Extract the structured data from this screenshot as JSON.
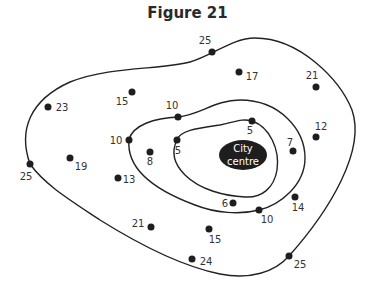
{
  "figure": {
    "title": "Figure 21",
    "city_centre_label_line1": "City",
    "city_centre_label_line2": "centre"
  },
  "points": [
    {
      "value": "25",
      "x": 212,
      "y": 52
    },
    {
      "value": "17",
      "x": 239,
      "y": 72
    },
    {
      "value": "21",
      "x": 316,
      "y": 87
    },
    {
      "value": "23",
      "x": 48,
      "y": 107
    },
    {
      "value": "15",
      "x": 132,
      "y": 92
    },
    {
      "value": "10",
      "x": 178,
      "y": 117
    },
    {
      "value": "5",
      "x": 252,
      "y": 121
    },
    {
      "value": "12",
      "x": 316,
      "y": 137
    },
    {
      "value": "10",
      "x": 129,
      "y": 140
    },
    {
      "value": "5",
      "x": 177,
      "y": 140
    },
    {
      "value": "7",
      "x": 293,
      "y": 151
    },
    {
      "value": "8",
      "x": 150,
      "y": 152
    },
    {
      "value": "19",
      "x": 70,
      "y": 158
    },
    {
      "value": "25",
      "x": 30,
      "y": 164
    },
    {
      "value": "13",
      "x": 118,
      "y": 178
    },
    {
      "value": "14",
      "x": 295,
      "y": 197
    },
    {
      "value": "6",
      "x": 233,
      "y": 203
    },
    {
      "value": "10",
      "x": 259,
      "y": 210
    },
    {
      "value": "21",
      "x": 151,
      "y": 227
    },
    {
      "value": "15",
      "x": 209,
      "y": 229
    },
    {
      "value": "24",
      "x": 192,
      "y": 259
    },
    {
      "value": "25",
      "x": 289,
      "y": 256
    }
  ],
  "contours": [
    {
      "value": 25,
      "label": "25"
    },
    {
      "value": 10,
      "label": "10"
    },
    {
      "value": 5,
      "label": "5"
    }
  ],
  "colors": {
    "line": "#222222",
    "dot": "#1e1e1e",
    "city_centre_fill": "#1e1e1e",
    "text": "#333333"
  }
}
